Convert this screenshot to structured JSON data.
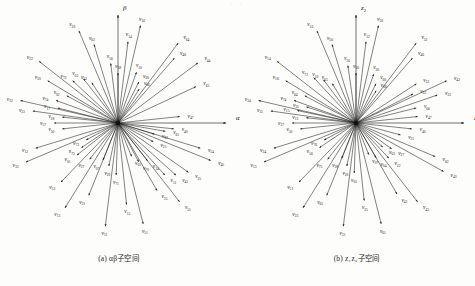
{
  "figure": {
    "panels": [
      {
        "id": "ab",
        "caption": "(a) αβ子空间",
        "axes": [
          {
            "name": "alpha-axis",
            "label": "α",
            "sub": "",
            "angle": 0,
            "length": 108
          },
          {
            "name": "beta-axis",
            "label": "β",
            "sub": "",
            "angle": 90,
            "length": 108
          }
        ],
        "vectors": [
          {
            "label": "v",
            "sub": "11",
            "angle": 263,
            "r": 104
          },
          {
            "label": "v",
            "sub": "51",
            "angle": 284,
            "r": 104
          },
          {
            "label": "v",
            "sub": "13",
            "angle": 238,
            "r": 100
          },
          {
            "label": "v",
            "sub": "55",
            "angle": 308,
            "r": 100
          },
          {
            "label": "v",
            "sub": "31",
            "angle": 248,
            "r": 78
          },
          {
            "label": "v",
            "sub": "53",
            "angle": 226,
            "r": 82
          },
          {
            "label": "v",
            "sub": "15",
            "angle": 276,
            "r": 82
          },
          {
            "label": "v",
            "sub": "35",
            "angle": 300,
            "r": 78
          },
          {
            "label": "v",
            "sub": "33",
            "angle": 203,
            "r": 100
          },
          {
            "label": "v",
            "sub": "12",
            "angle": 197,
            "r": 86
          },
          {
            "label": "v",
            "sub": "32",
            "angle": 167,
            "r": 100
          },
          {
            "label": "v",
            "sub": "23",
            "angle": 172,
            "r": 86
          },
          {
            "label": "v",
            "sub": "22",
            "angle": 142,
            "r": 100
          },
          {
            "label": "v",
            "sub": "30",
            "angle": 149,
            "r": 82
          },
          {
            "label": "v",
            "sub": "26",
            "angle": 113,
            "r": 100
          },
          {
            "label": "v",
            "sub": "62",
            "angle": 107,
            "r": 82
          },
          {
            "label": "v",
            "sub": "16",
            "angle": 77,
            "r": 100
          },
          {
            "label": "v",
            "sub": "34",
            "angle": 83,
            "r": 82
          },
          {
            "label": "v",
            "sub": "44",
            "angle": 37,
            "r": 100
          },
          {
            "label": "v",
            "sub": "46",
            "angle": 49,
            "r": 86
          },
          {
            "label": "v",
            "sub": "64",
            "angle": 53,
            "r": 100
          },
          {
            "label": "v",
            "sub": "65",
            "angle": 25,
            "r": 86
          },
          {
            "label": "v",
            "sub": "54",
            "angle": 343,
            "r": 86
          },
          {
            "label": "v",
            "sub": "45",
            "angle": 338,
            "r": 100
          },
          {
            "label": "v",
            "sub": "25",
            "angle": 325,
            "r": 86
          },
          {
            "label": "v",
            "sub": "41",
            "angle": 318,
            "r": 78
          },
          {
            "label": "v",
            "sub": "11b",
            "angle": 312,
            "r": 70
          },
          {
            "label": "v",
            "sub": "57",
            "angle": 180,
            "r": 64
          },
          {
            "label": "v",
            "sub": "50",
            "angle": 186,
            "r": 56
          },
          {
            "label": "v",
            "sub": "18",
            "angle": 174,
            "r": 56
          },
          {
            "label": "v",
            "sub": "17",
            "angle": 166,
            "r": 62
          },
          {
            "label": "v",
            "sub": "47",
            "angle": 6,
            "r": 62
          },
          {
            "label": "v",
            "sub": "40",
            "angle": 354,
            "r": 56
          },
          {
            "label": "v",
            "sub": "61",
            "angle": 350,
            "r": 48
          },
          {
            "label": "v",
            "sub": "74",
            "angle": 160,
            "r": 66
          },
          {
            "label": "v",
            "sub": "72",
            "angle": 137,
            "r": 62
          },
          {
            "label": "v",
            "sub": "02",
            "angle": 152,
            "r": 58
          },
          {
            "label": "v",
            "sub": "03",
            "angle": 128,
            "r": 56
          },
          {
            "label": "v",
            "sub": "52",
            "angle": 123,
            "r": 48
          },
          {
            "label": "v",
            "sub": "56",
            "angle": 97,
            "r": 60
          },
          {
            "label": "v",
            "sub": "58",
            "angle": 90,
            "r": 50
          },
          {
            "label": "v",
            "sub": "10",
            "angle": 70,
            "r": 54
          },
          {
            "label": "v",
            "sub": "60",
            "angle": 63,
            "r": 46
          },
          {
            "label": "v",
            "sub": "06",
            "angle": 58,
            "r": 40
          },
          {
            "label": "v",
            "sub": "63",
            "angle": 343,
            "r": 38
          },
          {
            "label": "v",
            "sub": "21",
            "angle": 332,
            "r": 40
          },
          {
            "label": "v",
            "sub": "14",
            "angle": 308,
            "r": 48
          },
          {
            "label": "v",
            "sub": "70",
            "angle": 298,
            "r": 44
          },
          {
            "label": "v",
            "sub": "05",
            "angle": 292,
            "r": 36
          },
          {
            "label": "v",
            "sub": "20",
            "angle": 258,
            "r": 44
          },
          {
            "label": "v",
            "sub": "71",
            "angle": 268,
            "r": 52
          },
          {
            "label": "v",
            "sub": "07",
            "angle": 248,
            "r": 40
          },
          {
            "label": "v",
            "sub": "27",
            "angle": 232,
            "r": 46
          },
          {
            "label": "v",
            "sub": "75",
            "angle": 214,
            "r": 44
          },
          {
            "label": "v",
            "sub": "73",
            "angle": 208,
            "r": 36
          },
          {
            "label": "v",
            "sub": "01",
            "angle": 218,
            "r": 52
          }
        ]
      },
      {
        "id": "z1z2",
        "caption": "(b) z₁z₂子空间",
        "axes": [
          {
            "name": "z1-axis",
            "label": "z",
            "sub": "1",
            "angle": 0,
            "length": 108
          },
          {
            "name": "z2-axis",
            "label": "z",
            "sub": "2",
            "angle": 90,
            "length": 108
          }
        ],
        "vectors": [
          {
            "label": "v",
            "sub": "31",
            "angle": 263,
            "r": 104
          },
          {
            "label": "v",
            "sub": "61",
            "angle": 284,
            "r": 104
          },
          {
            "label": "v",
            "sub": "23",
            "angle": 238,
            "r": 100
          },
          {
            "label": "v",
            "sub": "43",
            "angle": 308,
            "r": 100
          },
          {
            "label": "v",
            "sub": "65",
            "angle": 248,
            "r": 78
          },
          {
            "label": "v",
            "sub": "25",
            "angle": 276,
            "r": 78
          },
          {
            "label": "v",
            "sub": "51",
            "angle": 226,
            "r": 82
          },
          {
            "label": "v",
            "sub": "41",
            "angle": 300,
            "r": 82
          },
          {
            "label": "v",
            "sub": "13",
            "angle": 203,
            "r": 100
          },
          {
            "label": "v",
            "sub": "24",
            "angle": 197,
            "r": 86
          },
          {
            "label": "v",
            "sub": "34",
            "angle": 167,
            "r": 100
          },
          {
            "label": "v",
            "sub": "15",
            "angle": 172,
            "r": 86
          },
          {
            "label": "v",
            "sub": "14",
            "angle": 142,
            "r": 100
          },
          {
            "label": "v",
            "sub": "16b",
            "angle": 149,
            "r": 82
          },
          {
            "label": "v",
            "sub": "16",
            "angle": 113,
            "r": 100
          },
          {
            "label": "v",
            "sub": "56",
            "angle": 107,
            "r": 82
          },
          {
            "label": "v",
            "sub": "50",
            "angle": 77,
            "r": 100
          },
          {
            "label": "v",
            "sub": "12",
            "angle": 83,
            "r": 82
          },
          {
            "label": "v",
            "sub": "52",
            "angle": 53,
            "r": 100
          },
          {
            "label": "v",
            "sub": "46",
            "angle": 49,
            "r": 86
          },
          {
            "label": "v",
            "sub": "42",
            "angle": 25,
            "r": 100
          },
          {
            "label": "v",
            "sub": "33",
            "angle": 19,
            "r": 86
          },
          {
            "label": "v",
            "sub": "62",
            "angle": 337,
            "r": 86
          },
          {
            "label": "v",
            "sub": "43b",
            "angle": 331,
            "r": 100
          },
          {
            "label": "v",
            "sub": "32",
            "angle": 33,
            "r": 72
          },
          {
            "label": "v",
            "sub": "02",
            "angle": 27,
            "r": 64
          },
          {
            "label": "v",
            "sub": "66",
            "angle": 14,
            "r": 62
          },
          {
            "label": "v",
            "sub": "47",
            "angle": 6,
            "r": 62
          },
          {
            "label": "v",
            "sub": "40",
            "angle": 354,
            "r": 56
          },
          {
            "label": "v",
            "sub": "21",
            "angle": 345,
            "r": 46
          },
          {
            "label": "v",
            "sub": "74",
            "angle": 160,
            "r": 66
          },
          {
            "label": "v",
            "sub": "64",
            "angle": 152,
            "r": 58
          },
          {
            "label": "v",
            "sub": "15b",
            "angle": 168,
            "r": 60
          },
          {
            "label": "v",
            "sub": "35",
            "angle": 162,
            "r": 52
          },
          {
            "label": "v",
            "sub": "37",
            "angle": 180,
            "r": 64
          },
          {
            "label": "v",
            "sub": "30",
            "angle": 186,
            "r": 56
          },
          {
            "label": "v",
            "sub": "13b",
            "angle": 174,
            "r": 50
          },
          {
            "label": "v",
            "sub": "72",
            "angle": 133,
            "r": 62
          },
          {
            "label": "v",
            "sub": "10",
            "angle": 127,
            "r": 54
          },
          {
            "label": "v",
            "sub": "05",
            "angle": 121,
            "r": 46
          },
          {
            "label": "v",
            "sub": "36",
            "angle": 98,
            "r": 58
          },
          {
            "label": "v",
            "sub": "50b",
            "angle": 90,
            "r": 50
          },
          {
            "label": "v",
            "sub": "26",
            "angle": 70,
            "r": 52
          },
          {
            "label": "v",
            "sub": "60",
            "angle": 63,
            "r": 44
          },
          {
            "label": "v",
            "sub": "06",
            "angle": 58,
            "r": 38
          },
          {
            "label": "v",
            "sub": "22",
            "angle": 313,
            "r": 48
          },
          {
            "label": "v",
            "sub": "27",
            "angle": 324,
            "r": 44
          },
          {
            "label": "v",
            "sub": "03",
            "angle": 318,
            "r": 36
          },
          {
            "label": "v",
            "sub": "04",
            "angle": 300,
            "r": 40
          },
          {
            "label": "v",
            "sub": "07",
            "angle": 292,
            "r": 34
          },
          {
            "label": "v",
            "sub": "01",
            "angle": 268,
            "r": 50
          },
          {
            "label": "v",
            "sub": "20",
            "angle": 258,
            "r": 44
          },
          {
            "label": "v",
            "sub": "28",
            "angle": 248,
            "r": 38
          },
          {
            "label": "v",
            "sub": "75",
            "angle": 232,
            "r": 46
          },
          {
            "label": "v",
            "sub": "56b",
            "angle": 214,
            "r": 44
          },
          {
            "label": "v",
            "sub": "76",
            "angle": 208,
            "r": 36
          }
        ]
      }
    ]
  },
  "style": {
    "vector_color": "#1c1c1c",
    "axis_color": "#333333",
    "background": "#fdfdfb"
  }
}
